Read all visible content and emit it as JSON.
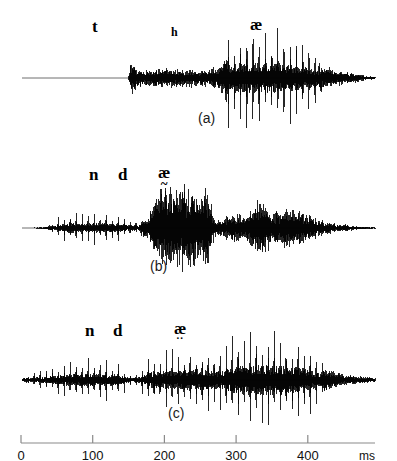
{
  "figure": {
    "background_color": "#ffffff",
    "waveform_color": "#000000",
    "axis_color": "#8a8a8a",
    "baseline_color": "#6f6f6f"
  },
  "panels": [
    {
      "id": "a",
      "caption": "(a)",
      "caption_x": 198,
      "caption_y": 110,
      "labels": [
        {
          "text": "t",
          "x": 92,
          "y": 18,
          "size": "main",
          "diacritic": ""
        },
        {
          "text": "h",
          "x": 171,
          "y": 26,
          "size": "small",
          "diacritic": ""
        },
        {
          "text": "æ",
          "x": 250,
          "y": 16,
          "size": "main",
          "diacritic": ""
        }
      ]
    },
    {
      "id": "b",
      "caption": "(b)",
      "caption_x": 150,
      "caption_y": 108,
      "labels": [
        {
          "text": "n",
          "x": 89,
          "y": 16,
          "size": "main",
          "diacritic": ""
        },
        {
          "text": "d",
          "x": 118,
          "y": 16,
          "size": "main",
          "diacritic": ""
        },
        {
          "text": "æ",
          "x": 158,
          "y": 14,
          "size": "main",
          "diacritic": "~"
        }
      ]
    },
    {
      "id": "c",
      "caption": "(c)",
      "caption_x": 168,
      "caption_y": 105,
      "labels": [
        {
          "text": "n",
          "x": 85,
          "y": 22,
          "size": "main",
          "diacritic": ""
        },
        {
          "text": "d",
          "x": 113,
          "y": 22,
          "size": "main",
          "diacritic": ""
        },
        {
          "text": "æ",
          "x": 174,
          "y": 20,
          "size": "main",
          "diacritic": ".."
        }
      ]
    }
  ],
  "axis": {
    "unit_label": "ms",
    "unit_x": 359,
    "tick_values": [
      0,
      100,
      200,
      300,
      400
    ],
    "tick_labels": [
      "0",
      "100",
      "200",
      "300",
      "400"
    ],
    "x_start_px": 21,
    "px_per_100ms": 71.7,
    "line_end_px": 375
  },
  "chart_data": {
    "type": "line",
    "title": "",
    "subtitle": "",
    "xlabel": "ms",
    "ylabel": "",
    "xlim": [
      -29,
      493
    ],
    "grid": false,
    "legend_position": "none",
    "series": [
      {
        "name": "(a)",
        "phonetic_segments": [
          "t",
          "h",
          "æ"
        ],
        "baseline_y": 78,
        "x_range_px": [
          22,
          375
        ],
        "envelope_x": [
          22,
          128,
          131,
          136,
          142,
          150,
          160,
          172,
          185,
          196,
          207,
          216,
          222,
          228,
          238,
          252,
          266,
          278,
          290,
          300,
          310,
          320,
          332,
          344,
          356,
          368,
          375
        ],
        "envelope_amp": [
          0,
          0,
          17,
          9,
          7,
          8,
          9,
          8,
          7,
          8,
          7,
          9,
          14,
          27,
          28,
          29,
          28,
          27,
          25,
          22,
          18,
          12,
          8,
          6,
          4,
          2,
          1
        ],
        "pulse_start_px": 228,
        "pulse_end_px": 318,
        "pulse_period_px": 6.2
      },
      {
        "name": "(b)",
        "phonetic_segments": [
          "n",
          "d",
          "æ̃"
        ],
        "baseline_y": 228,
        "x_range_px": [
          22,
          375
        ],
        "envelope_x": [
          22,
          45,
          52,
          60,
          72,
          86,
          100,
          114,
          126,
          138,
          146,
          150,
          158,
          168,
          178,
          190,
          200,
          208,
          214,
          222,
          232,
          244,
          252,
          262,
          272,
          284,
          296,
          308,
          320,
          336,
          352,
          368,
          375
        ],
        "envelope_amp": [
          0,
          1,
          3,
          7,
          9,
          9,
          9,
          8,
          6,
          5,
          9,
          20,
          34,
          38,
          37,
          38,
          35,
          30,
          9,
          7,
          14,
          10,
          20,
          24,
          16,
          18,
          16,
          11,
          7,
          4,
          2,
          1,
          1
        ],
        "pulse_start_px": 52,
        "pulse_end_px": 140,
        "pulse_period_px": 6.0
      },
      {
        "name": "(c)",
        "phonetic_segments": [
          "n",
          "d",
          "æ̤"
        ],
        "baseline_y": 380,
        "x_range_px": [
          22,
          375
        ],
        "envelope_x": [
          22,
          30,
          42,
          56,
          70,
          84,
          96,
          110,
          120,
          128,
          136,
          144,
          152,
          162,
          172,
          184,
          196,
          208,
          220,
          232,
          244,
          256,
          268,
          282,
          296,
          308,
          318,
          328,
          340,
          352,
          364,
          375
        ],
        "envelope_amp": [
          2,
          4,
          6,
          8,
          11,
          12,
          12,
          11,
          9,
          5,
          4,
          9,
          15,
          16,
          17,
          18,
          19,
          18,
          16,
          24,
          27,
          28,
          28,
          27,
          25,
          20,
          13,
          9,
          6,
          4,
          3,
          2
        ],
        "pulse_start_px": 28,
        "pulse_end_px": 322,
        "pulse_period_px": 6.0
      }
    ]
  }
}
